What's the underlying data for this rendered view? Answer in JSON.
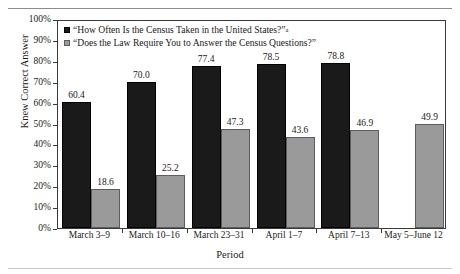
{
  "figure": {
    "top_caption_partial": "",
    "y_axis_title": "Knew Correct Answer",
    "x_axis_title": "Period"
  },
  "chart_data": {
    "type": "bar",
    "title": "",
    "xlabel": "Period",
    "ylabel": "Knew Correct Answer",
    "ylim": [
      0,
      100
    ],
    "ytick_labels": [
      "0%",
      "10%",
      "20%",
      "30%",
      "40%",
      "50%",
      "60%",
      "70%",
      "80%",
      "90%",
      "100%"
    ],
    "ytick_values": [
      0,
      10,
      20,
      30,
      40,
      50,
      60,
      70,
      80,
      90,
      100
    ],
    "grid": false,
    "legend_position": "top-left-inside",
    "categories": [
      "March 3–9",
      "March 10–16",
      "March 23–31",
      "April 1–7",
      "April 7–13",
      "May 5–June 12"
    ],
    "series": [
      {
        "name": "“How Often Is the Census Taken in the United States?”",
        "name_superscript": "a",
        "color": "#1a1a1a",
        "values": [
          60.4,
          70.0,
          77.4,
          78.5,
          78.8,
          null
        ],
        "value_labels": [
          "60.4",
          "70.0",
          "77.4",
          "78.5",
          "78.8",
          ""
        ]
      },
      {
        "name": "“Does the Law Require You to Answer the Census Questions?”",
        "name_superscript": "",
        "color": "#9a9a9a",
        "values": [
          18.6,
          25.2,
          47.3,
          43.6,
          46.9,
          49.9
        ],
        "value_labels": [
          "18.6",
          "25.2",
          "47.3",
          "43.6",
          "46.9",
          "49.9"
        ]
      }
    ]
  },
  "legend": {
    "items": [
      {
        "label": "“How Often Is the Census Taken in the United States?”",
        "superscript": "a",
        "swatch": "black-square-swatch"
      },
      {
        "label": "“Does the Law Require You to Answer the Census Questions?”",
        "superscript": "",
        "swatch": "gray-square-swatch"
      }
    ]
  }
}
